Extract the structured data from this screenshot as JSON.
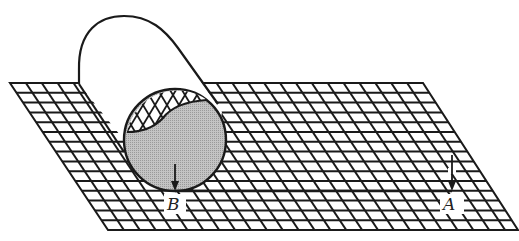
{
  "figure": {
    "labels": {
      "point_b": "B",
      "point_a": "A"
    },
    "colors": {
      "line": "#1a1a1a",
      "shaded_end": "#b8b8b8",
      "background": "#ffffff"
    },
    "grid": {
      "top_left": [
        10,
        83
      ],
      "top_right": [
        423,
        83
      ],
      "bottom_left": [
        108,
        230
      ],
      "bottom_right": [
        518,
        230
      ],
      "rows": 15,
      "columns": 26
    },
    "cylinder": {
      "end_center": [
        175,
        140
      ],
      "end_radius": 51
    },
    "arrows": [
      {
        "name": "arrow-at-b",
        "from": [
          175,
          164
        ],
        "to": [
          175,
          190
        ]
      },
      {
        "name": "arrow-at-a",
        "from": [
          452,
          155
        ],
        "to": [
          452,
          190
        ]
      }
    ]
  }
}
